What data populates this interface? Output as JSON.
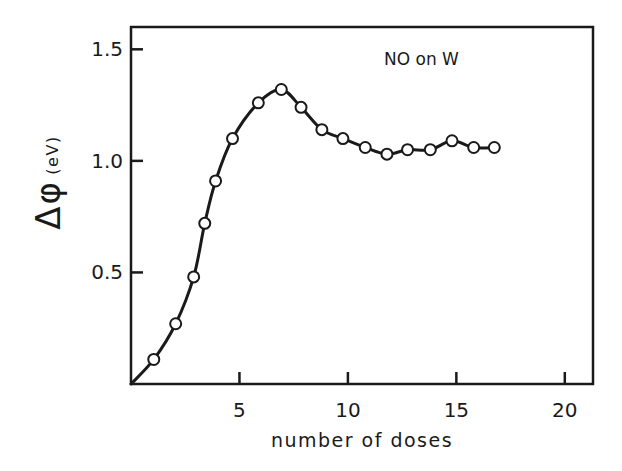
{
  "chart_data": {
    "type": "line",
    "title": "",
    "annotation": "NO on W",
    "xlabel": "number of doses",
    "ylabel": "Δφ̄ (eV)",
    "ylabel_symbol": "Δφ",
    "ylabel_unit": "(eV)",
    "xlim": [
      0,
      21.3
    ],
    "ylim": [
      0,
      1.6
    ],
    "xticks": [
      5,
      10,
      15,
      20
    ],
    "xtick_labels": [
      "5",
      "10",
      "15",
      "20"
    ],
    "yticks": [
      0.5,
      1.0,
      1.5
    ],
    "ytick_labels": [
      "0.5",
      "1.0",
      "1.5"
    ],
    "grid": false,
    "legend": null,
    "series": [
      {
        "name": "NO on W",
        "marker": "open-circle",
        "line": "smooth",
        "x": [
          0,
          1.05,
          2.06,
          2.89,
          3.4,
          3.9,
          4.68,
          5.87,
          6.93,
          7.84,
          8.8,
          9.77,
          10.8,
          11.8,
          12.75,
          13.8,
          14.8,
          15.8,
          16.75
        ],
        "y": [
          0,
          0.11,
          0.27,
          0.48,
          0.72,
          0.91,
          1.1,
          1.26,
          1.32,
          1.24,
          1.14,
          1.1,
          1.06,
          1.03,
          1.05,
          1.05,
          1.09,
          1.06,
          1.06
        ]
      }
    ],
    "colors": {
      "ink": "#1a1a1a",
      "background": "#ffffff"
    }
  }
}
